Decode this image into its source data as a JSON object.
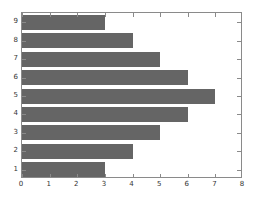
{
  "chart_data": {
    "type": "bar",
    "orientation": "horizontal",
    "title": "",
    "xlabel": "",
    "ylabel": "",
    "categories": [
      "1",
      "2",
      "3",
      "4",
      "5",
      "6",
      "7",
      "8",
      "9"
    ],
    "values": [
      3,
      4,
      5,
      6,
      7,
      6,
      5,
      4,
      3
    ],
    "xlim": [
      0,
      8
    ],
    "xticks": [
      0,
      1,
      2,
      3,
      4,
      5,
      6,
      7,
      8
    ],
    "xticklabels": [
      "0",
      "1",
      "2",
      "3",
      "4",
      "5",
      "6",
      "7",
      "8"
    ],
    "yticklabels": [
      "1",
      "2",
      "3",
      "4",
      "5",
      "6",
      "7",
      "8",
      "9"
    ],
    "grid": false,
    "legend": null,
    "bar_color": "#656565",
    "axis_color": "#8a8a8a",
    "background_color": "#ffffff"
  }
}
